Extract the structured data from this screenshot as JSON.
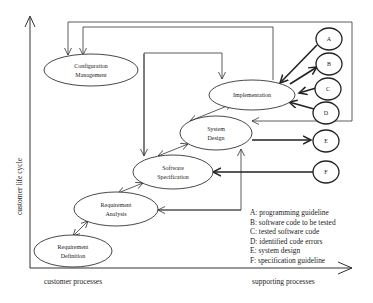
{
  "diagram": {
    "axes": {
      "y_label": "customer life cycle",
      "x_label_left": "customer processes",
      "x_label_right": "supporting processes"
    },
    "processes": [
      {
        "id": "config",
        "line1": "Configuration",
        "line2": "Management"
      },
      {
        "id": "impl",
        "line1": "Implementation",
        "line2": ""
      },
      {
        "id": "sysdesign",
        "line1": "System",
        "line2": "Design"
      },
      {
        "id": "swspec",
        "line1": "Software",
        "line2": "Specification"
      },
      {
        "id": "reqanalysis",
        "line1": "Requirement",
        "line2": "Analysis"
      },
      {
        "id": "reqdef",
        "line1": "Requirement",
        "line2": "Definition"
      }
    ],
    "artifacts": [
      {
        "id": "A",
        "label": "A"
      },
      {
        "id": "B",
        "label": "B"
      },
      {
        "id": "C",
        "label": "C"
      },
      {
        "id": "D",
        "label": "D"
      },
      {
        "id": "E",
        "label": "E"
      },
      {
        "id": "F",
        "label": "F"
      }
    ],
    "legend": [
      "A: programming guideline",
      "B: software code to be tested",
      "C: tested software code",
      "D: identified code errors",
      "E: system design",
      "F: specification guideline"
    ]
  }
}
